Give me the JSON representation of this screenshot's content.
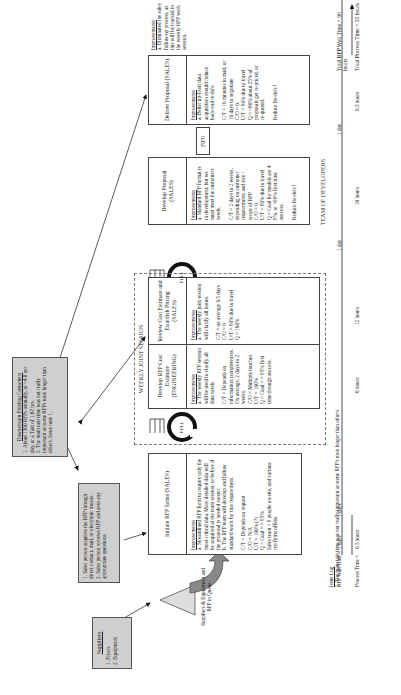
{
  "diagram": {
    "type": "value-stream-map",
    "orientation": "rotated-90-ccw"
  },
  "suppliers": {
    "title": "Suppliers",
    "items": [
      "1. Fryers",
      "2. Equipment"
    ]
  },
  "sales_contact_note": {
    "lines": "1. Sales person acquires the RFP through direct contact, mail, or electronic means.\n2. Sales person reviews RFP and asks any appropriate questions."
  },
  "customer_note": {
    "title": "Downstream Existing Customers",
    "lines": "1. About 1300 RFPs annually, or ~4.8 per day, or a Takt of 1.67 hrs.\n2. The main takt time was not really important as some RFPs took longer than others. Issue note 1."
  },
  "queue": {
    "label": "Suppliers & Equipment and RFP in Queue"
  },
  "weekly_session_label": "WEEKLY JOINT SESSION",
  "collocated_label": "COLLOCATED TEAMS",
  "team_label": "TEAM OF DEVELOPERS",
  "fifo_label": "FIFO",
  "pull_label": "PULL",
  "processes": [
    {
      "title": "Initiate RFP forms (SALES)",
      "improvements_label": "Improvements",
      "text": "a. Streamlined RFP form to require only the most critical data. More detailed data will be acquired at the team session, or before if the proposal is needed sooner.\nb. The RFP team will develop and follow standard work for this requirement.\n\nC/T = Depends on request\nC/O = N/A\nU/T = 100% (?)\nQ = Goal = > 95%\nSales team = 9 people on-site, and various rep firms offsite."
    },
    {
      "title": "Develop RFP Cost Estimate (ENGINEERING)",
      "improvements_label": "Improvements",
      "text": "a. The weekly RFP session will be used to clarify all data needs.\n\nC/T = Depends on information completeness. On average, 2 days to 2 weeks.\nC/O = Multiple touches\nU/T = 100%\nQ = Goal = > 95% first time through success."
    },
    {
      "title": "Review Cost Estimate and Establish Pricing (SALES)",
      "improvements_label": "Improvements",
      "text": "a. The weekly joint session will clarify all issues.\n\nC/T = on average 0.5 days\nC/O = 0\nU/T = 90% due to travel\nQ = 100%"
    },
    {
      "title": "Develop Proposal (SALES)",
      "improvements_label": "Improvements",
      "text": "a. Standard RFP format is in development, but we must meet the customers needs.\n\nC/T = 2 days to 2 weeks, depending on customer requirements and size / scope of RFP\nC/O = 0\nU/T = 90% due to travel\nQ = Goal for models are 4 9%, or >99% first time success.\n\nReduce Re-do's !"
    },
    {
      "title": "Deliver Proposal (SALES)",
      "improvements_label": "Improvements",
      "text": "a. Better up-front data acquisition should reduce back-end re-do's.\n\nC/T = 10 minutes to mail, or 10 days to negotiate\nC/O = 0.\nU/T = 90% due to travel\nQ = ~80% about 25% of proposals get re-priced, or re-quoted.\n\nReduce Re-do's !"
    }
  ],
  "final_note": {
    "improvements_label": "Improvements",
    "text": "a. Eliminated the sales follow-up process, as this will be tracked in the weekly RFP work session."
  },
  "issue_log": {
    "title": "Issue Log",
    "text": "1. The main takt time was not really important as some RFP's took longer than others."
  },
  "timeline": {
    "wait_label": "RFP Wait Time =",
    "process_label": "Process Time =",
    "wait_times": [
      "1 days",
      "1 days",
      "1 day",
      "1 day"
    ],
    "process_times": [
      "0.5 hours",
      "6 hours",
      "12 hours",
      "16 hours",
      "0.5 hours"
    ],
    "total_wait": "Total RFP Wait Time = 90 hours",
    "total_process": "Total Process Time = 35 hours"
  }
}
